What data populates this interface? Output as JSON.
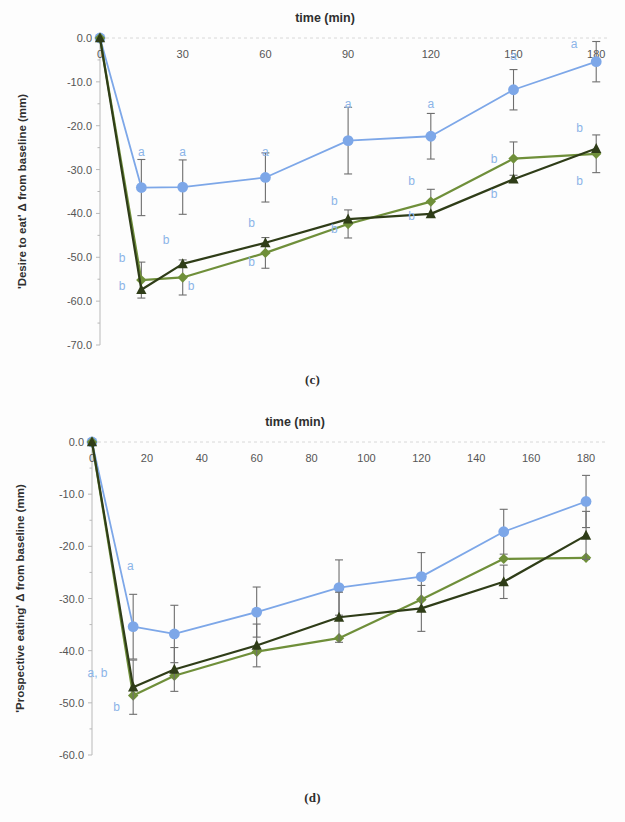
{
  "figure": {
    "panels": [
      {
        "id": "c",
        "caption": "(c)"
      },
      {
        "id": "d",
        "caption": "(d)"
      }
    ]
  },
  "colors": {
    "series_blue": "#7da7e8",
    "series_green_diamond": "#6f8f3a",
    "series_dark_triangle": "#2f3d18",
    "error_bar": "#6e6e6e",
    "annotation": "#8bb4e8",
    "axis": "#b9b9b9",
    "grid": "#d8d8d8"
  },
  "chart_data": [
    {
      "type": "line",
      "panel": "c",
      "title": "time (min)",
      "xlabel": "time (min)",
      "ylabel": "'Desire to eat' Δ from baseline (mm)",
      "xlim": [
        0,
        185
      ],
      "ylim": [
        -70,
        0
      ],
      "xticks": [
        0,
        30,
        60,
        90,
        120,
        150,
        180
      ],
      "xticklabels": [
        "0",
        "30",
        "60",
        "90",
        "120",
        "150",
        "180"
      ],
      "yticks": [
        0,
        -10,
        -20,
        -30,
        -40,
        -50,
        -60,
        -70
      ],
      "yticklabels": [
        "0.0",
        "-10.0",
        "-20.0",
        "-30.0",
        "-40.0",
        "-50.0",
        "-60.0",
        "-70.0"
      ],
      "grid": false,
      "legend": "none",
      "x": [
        0,
        15,
        30,
        60,
        90,
        120,
        150,
        180
      ],
      "series": [
        {
          "name": "blue-circle",
          "marker": "circle",
          "color": "#7da7e8",
          "values": [
            0.0,
            -34.1,
            -34.0,
            -31.8,
            -23.4,
            -22.4,
            -11.8,
            -5.4
          ],
          "errors": [
            0.0,
            6.4,
            6.2,
            5.6,
            7.6,
            5.2,
            4.6,
            4.6
          ]
        },
        {
          "name": "green-diamond",
          "marker": "diamond",
          "color": "#6f8f3a",
          "values": [
            0.0,
            -55.2,
            -54.6,
            -49.0,
            -42.4,
            -37.3,
            -27.5,
            -26.4
          ],
          "errors": [
            0.0,
            4.1,
            4.0,
            3.5,
            3.2,
            2.8,
            3.8,
            4.3
          ]
        },
        {
          "name": "dark-triangle",
          "marker": "triangle",
          "color": "#2f3d18",
          "values": [
            0.0,
            -57.4,
            -51.5,
            -46.7,
            -41.3,
            -40.1,
            -32.2,
            -25.2
          ]
        }
      ],
      "annotations": [
        {
          "text": "a",
          "x": 15,
          "y": -27.0
        },
        {
          "text": "a",
          "x": 30,
          "y": -27.0
        },
        {
          "text": "a",
          "x": 60,
          "y": -27.0
        },
        {
          "text": "a",
          "x": 90,
          "y": -16.0
        },
        {
          "text": "a",
          "x": 120,
          "y": -16.0
        },
        {
          "text": "a",
          "x": 150,
          "y": -5.0
        },
        {
          "text": "a",
          "x": 172,
          "y": -2.3
        },
        {
          "text": "b",
          "x": 8,
          "y": -51.0
        },
        {
          "text": "b",
          "x": 8,
          "y": -57.5
        },
        {
          "text": "b",
          "x": 24,
          "y": -47.0
        },
        {
          "text": "b",
          "x": 33,
          "y": -57.5
        },
        {
          "text": "b",
          "x": 55,
          "y": -43.0
        },
        {
          "text": "b",
          "x": 55,
          "y": -52.0
        },
        {
          "text": "b",
          "x": 85,
          "y": -38.0
        },
        {
          "text": "b",
          "x": 85,
          "y": -44.5
        },
        {
          "text": "b",
          "x": 113,
          "y": -33.5
        },
        {
          "text": "b",
          "x": 113,
          "y": -41.5
        },
        {
          "text": "b",
          "x": 143,
          "y": -28.5
        },
        {
          "text": "b",
          "x": 143,
          "y": -36.5
        },
        {
          "text": "b",
          "x": 174,
          "y": -21.5
        },
        {
          "text": "b",
          "x": 174,
          "y": -33.5
        }
      ]
    },
    {
      "type": "line",
      "panel": "d",
      "title": "time (min)",
      "xlabel": "time (min)",
      "ylabel": "'Prospective eating' Δ from baseline (mm)",
      "xlim": [
        0,
        188
      ],
      "ylim": [
        -60,
        0
      ],
      "xticks": [
        0,
        20,
        40,
        60,
        80,
        100,
        120,
        140,
        160,
        180
      ],
      "xticklabels": [
        "0",
        "20",
        "40",
        "60",
        "80",
        "100",
        "120",
        "140",
        "160",
        "180"
      ],
      "yticks": [
        0,
        -10,
        -20,
        -30,
        -40,
        -50,
        -60
      ],
      "yticklabels": [
        "0.0",
        "-10.0",
        "-20.0",
        "-30.0",
        "-40.0",
        "-50.0",
        "-60.0"
      ],
      "grid": false,
      "legend": "none",
      "x": [
        0,
        15,
        30,
        60,
        90,
        120,
        150,
        180
      ],
      "series": [
        {
          "name": "blue-circle",
          "marker": "circle",
          "color": "#7da7e8",
          "values": [
            0.0,
            -35.4,
            -36.8,
            -32.6,
            -27.9,
            -25.8,
            -17.2,
            -11.4
          ],
          "errors": [
            0.0,
            6.2,
            5.5,
            4.8,
            5.3,
            4.6,
            4.3,
            5.0
          ]
        },
        {
          "name": "green-diamond",
          "marker": "diamond",
          "color": "#6f8f3a",
          "values": [
            0.0,
            -48.6,
            -44.8,
            -40.2,
            -37.6,
            -30.2,
            -22.4,
            -22.2
          ]
        },
        {
          "name": "dark-triangle",
          "marker": "triangle",
          "color": "#2f3d18",
          "values": [
            0.0,
            -47.0,
            -43.6,
            -39.0,
            -33.6,
            -31.9,
            -26.8,
            -17.9
          ],
          "errors": [
            0.0,
            5.2,
            4.2,
            4.1,
            4.8,
            4.4,
            3.2,
            4.6
          ]
        }
      ],
      "annotations": [
        {
          "text": "a",
          "x": 14,
          "y": -24.5
        },
        {
          "text": "a, b",
          "x": 2,
          "y": -45.0
        },
        {
          "text": "b",
          "x": 9,
          "y": -51.5
        }
      ]
    }
  ]
}
